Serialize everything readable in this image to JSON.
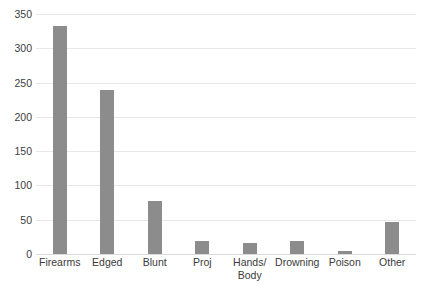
{
  "chart_data": {
    "type": "bar",
    "title": "",
    "subtitle": "",
    "xlabel": "",
    "ylabel": "",
    "categories": [
      "Firearms",
      "Edged",
      "Blunt",
      "Proj",
      "Hands/\nBody",
      "Drowning",
      "Poison",
      "Other"
    ],
    "values": [
      333,
      239,
      77,
      19,
      16,
      19,
      5,
      46
    ],
    "ylim": [
      0,
      350
    ],
    "ytick_labels": [
      "350",
      "300",
      "250",
      "200",
      "150",
      "100",
      "50",
      "0"
    ],
    "ytick_values": [
      350,
      300,
      250,
      200,
      150,
      100,
      50,
      0
    ],
    "grid": true,
    "grid_axis": "y",
    "legend": false,
    "legend_position": "none",
    "series": [
      {
        "name": "",
        "values": [
          333,
          239,
          77,
          19,
          16,
          19,
          5,
          46
        ]
      }
    ],
    "colors": {
      "bar": "#8c8c8c",
      "gridline": "#e7e7e7",
      "baseline": "#d9d9d9",
      "tick_label": "#404040",
      "background": "#ffffff"
    }
  }
}
